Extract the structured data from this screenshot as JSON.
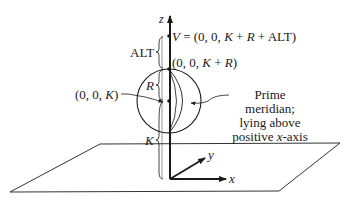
{
  "diagram": {
    "axes": {
      "z_label": "z",
      "x_label": "x",
      "y_label": "y"
    },
    "labels": {
      "viewpoint": "V = (0, 0, K + R + ALT)",
      "viewpoint_parts": {
        "v": "V",
        "eq": " = (0, 0, ",
        "k": "K",
        "plus1": " + ",
        "r": "R",
        "plus2": " + ALT)"
      },
      "sphere_top": "(0, 0, K + R)",
      "sphere_top_parts": {
        "open": "(0, 0, ",
        "k": "K",
        "plus": " + ",
        "r": "R",
        "close": ")"
      },
      "sphere_center": "(0, 0, K)",
      "sphere_center_parts": {
        "open": "(0, 0, ",
        "k": "K",
        "close": ")"
      },
      "alt_brace": "ALT",
      "r_brace": "R",
      "k_brace": "K"
    },
    "annotation": {
      "line1": "Prime meridian;",
      "line2": "lying above",
      "line3_pre": "positive ",
      "line3_var": "x",
      "line3_post": "-axis",
      "full": "Prime meridian; lying above positive x-axis"
    },
    "colors": {
      "ink": "#1a1a1a",
      "background": "#ffffff"
    }
  }
}
